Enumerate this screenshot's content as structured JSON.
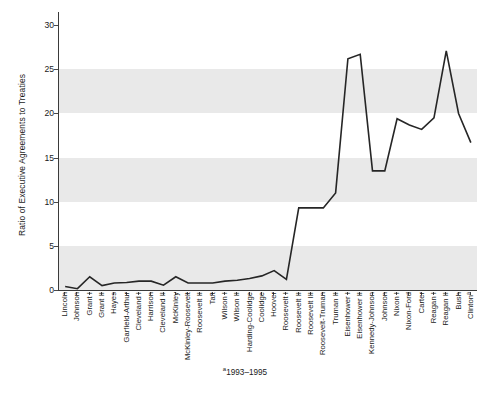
{
  "chart_data": {
    "type": "line",
    "title": "",
    "xlabel": "",
    "ylabel": "Ratio of Executive Agreements to Treaties",
    "ylim": [
      0,
      31.5
    ],
    "yticks": [
      0,
      5,
      10,
      15,
      20,
      25,
      30
    ],
    "grid": "horizontal alternating gray bands",
    "legend": "none",
    "annotations": [
      "a1993-1995"
    ],
    "footnote": "1993–1995",
    "footnote_marker": "a",
    "line_color": "#262626",
    "band_color": "#e9e9e9",
    "categories": [
      "Lincoln",
      "Johnson",
      "Grant I",
      "Grant II",
      "Hayes",
      "Garfield-Arthur",
      "Cleveland I",
      "Harrison",
      "Cleveland II",
      "McKinley",
      "McKinley-Roosevelt",
      "Roosevelt II",
      "Taft",
      "Wilson I",
      "Wilson II",
      "Harding-Coolidge",
      "Coolidge",
      "Hoover",
      "Roosevelt I",
      "Roosevelt II",
      "Roosevelt III",
      "Roosevelt-Truman",
      "Truman II",
      "Eisenhower I",
      "Eisenhower II",
      "Kennedy-Johnson",
      "Johnson",
      "Nixon I",
      "Nixon-Ford",
      "Carter",
      "Reagan I",
      "Reagan II",
      "Bush",
      "Clinton"
    ],
    "category_superscripts": {
      "33": "a"
    },
    "values": [
      0.4,
      0.15,
      1.5,
      0.5,
      0.8,
      0.85,
      1.0,
      1.0,
      0.55,
      1.5,
      0.8,
      0.8,
      0.8,
      1.0,
      1.1,
      1.3,
      1.6,
      2.2,
      1.2,
      9.3,
      9.3,
      9.3,
      11.0,
      26.2,
      26.7,
      13.5,
      13.5,
      19.4,
      18.7,
      18.2,
      19.5,
      27.1,
      20.0,
      16.7
    ]
  }
}
